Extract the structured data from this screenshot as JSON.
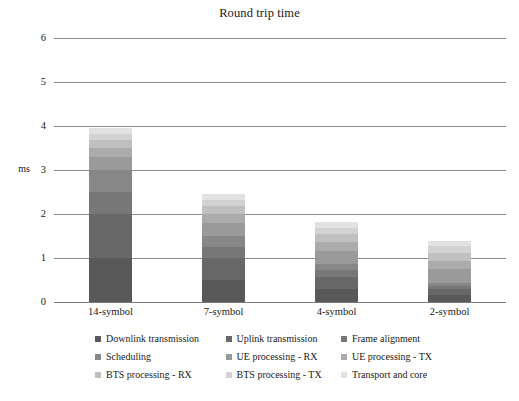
{
  "chart_data": {
    "type": "bar",
    "subtype": "stacked-column",
    "title": "Round trip time",
    "xlabel": "",
    "ylabel": "ms",
    "ylim": [
      0,
      6
    ],
    "yticks": [
      0,
      1,
      2,
      3,
      4,
      5,
      6
    ],
    "ytick_labels": [
      "0",
      "1",
      "2",
      "3",
      "4",
      "5",
      "6"
    ],
    "grid": true,
    "legend_position": "bottom",
    "categories": [
      "14-symbol",
      "7-symbol",
      "4-symbol",
      "2-symbol"
    ],
    "series": [
      {
        "name": "Downlink transmission",
        "color": "#595959",
        "values": [
          1.0,
          0.5,
          0.29,
          0.15
        ]
      },
      {
        "name": "Uplink transmission",
        "color": "#686868",
        "values": [
          1.0,
          0.5,
          0.29,
          0.15
        ]
      },
      {
        "name": "Frame alignment",
        "color": "#777777",
        "values": [
          0.5,
          0.25,
          0.14,
          0.07
        ]
      },
      {
        "name": "Scheduling",
        "color": "#878787",
        "values": [
          0.5,
          0.25,
          0.14,
          0.07
        ]
      },
      {
        "name": "UE processing - RX",
        "color": "#9a9a9a",
        "values": [
          0.3,
          0.3,
          0.3,
          0.3
        ]
      },
      {
        "name": "UE processing - TX",
        "color": "#ababab",
        "values": [
          0.2,
          0.2,
          0.2,
          0.2
        ]
      },
      {
        "name": "BTS processing - RX",
        "color": "#c0c0c0",
        "values": [
          0.18,
          0.18,
          0.18,
          0.18
        ]
      },
      {
        "name": "BTS processing - TX",
        "color": "#d2d2d2",
        "values": [
          0.15,
          0.15,
          0.15,
          0.15
        ]
      },
      {
        "name": "Transport and core",
        "color": "#e2e2e2",
        "values": [
          0.12,
          0.12,
          0.12,
          0.12
        ]
      }
    ],
    "totals": [
      3.95,
      2.45,
      1.81,
      1.39
    ]
  },
  "axis": {
    "unit_label": "ms"
  },
  "legend_rows": [
    [
      {
        "label": "Downlink transmission",
        "color": "#595959"
      },
      {
        "label": "Uplink transmission",
        "color": "#686868"
      },
      {
        "label": "Frame alignment",
        "color": "#777777"
      }
    ],
    [
      {
        "label": "Scheduling",
        "color": "#878787"
      },
      {
        "label": "UE processing - RX",
        "color": "#9a9a9a"
      },
      {
        "label": "UE processing - TX",
        "color": "#ababab"
      }
    ],
    [
      {
        "label": "BTS processing - RX",
        "color": "#c0c0c0"
      },
      {
        "label": "BTS processing - TX",
        "color": "#d2d2d2"
      },
      {
        "label": "Transport and core",
        "color": "#e2e2e2"
      }
    ]
  ]
}
